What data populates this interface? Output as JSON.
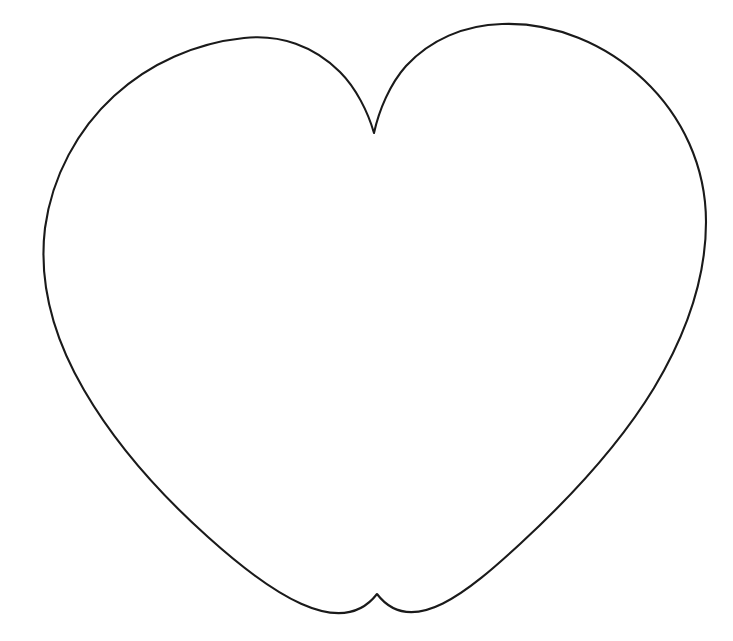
{
  "document": {
    "type": "line-art-drawing",
    "subject": "heart outline",
    "title": "Heart Outline Template",
    "background_color": "#ffffff",
    "width": 733,
    "height": 641,
    "text_content": [],
    "notes": "Single closed black outline of a symmetrical heart shape on a plain white background. No text, labels, numbers, or UI controls are present in the image."
  },
  "figure": {
    "name": "heart-shape",
    "stroke_color": "#1a1a1a",
    "stroke_width": 2.1,
    "fill": "none",
    "rendering": "hand-drawn scanned line art",
    "landmarks": {
      "left_lobe_apex": {
        "x": 218,
        "y": 38
      },
      "right_lobe_apex": {
        "x": 527,
        "y": 23
      },
      "top_cleft_notch": {
        "x": 374,
        "y": 133
      },
      "leftmost_point": {
        "x": 45,
        "y": 235
      },
      "rightmost_point": {
        "x": 706,
        "y": 210
      },
      "bottom_tip": {
        "x": 377,
        "y": 594
      }
    },
    "bounding_box": {
      "x": 44,
      "y": 21,
      "width": 663,
      "height": 575
    },
    "path_d": "M 374 133 C 368 112 356 88 340 72 C 314 46 280 34 244 38 C 196 43 150 63 114 96 C 78 129 52 176 45 228 C 38 286 56 342 84 390 C 116 445 160 494 208 537 C 268 591 340 642 377 594 L 377 594 C 412 640 470 590 520 544 C 572 496 620 444 654 388 C 684 338 706 280 706 222 C 706 166 682 116 644 80 C 606 44 554 22 502 24 C 464 25 430 40 406 66 C 390 84 379 110 374 133 Z",
    "path_segments": [
      {
        "name": "left-lobe-upper",
        "description": "from cleft notch up-left over the left lobe crest to the left extremity",
        "d": "M 374 133 C 366 110 353 86 336 70 C 310 45 276 33 242 38 C 194 44 148 65 112 98 C 77 131 50 177 45 230"
      },
      {
        "name": "left-lower-flank",
        "description": "left extremity curving down and right toward the bottom tip",
        "d": "M 45 230 C 41 290 60 348 90 398 C 124 454 170 503 220 547 C 270 590 340 600 377 594"
      },
      {
        "name": "right-lower-flank",
        "description": "bottom tip rising right to the right extremity",
        "d": "M 377 594 C 416 600 482 586 530 544 C 580 500 626 450 658 394 C 688 342 708 282 706 216"
      },
      {
        "name": "right-lobe-upper",
        "description": "right extremity curving up and left over the right lobe crest back to the cleft notch",
        "d": "M 706 216 C 704 160 680 112 642 78 C 604 44 552 22 500 24 C 462 26 428 41 405 67 C 388 86 379 111 374 133"
      }
    ]
  },
  "chart_data": {
    "type": "line",
    "title": "Heart Outline Template",
    "xlabel": "",
    "ylabel": "",
    "xlim": [
      0,
      733
    ],
    "ylim": [
      641,
      0
    ],
    "grid": false,
    "legend": "none",
    "series": [
      {
        "name": "heart-outline",
        "closed": true,
        "color": "#1a1a1a",
        "linewidth": 2.1,
        "x": [
          374,
          366,
          353,
          336,
          310,
          276,
          242,
          194,
          148,
          112,
          77,
          45,
          41,
          60,
          90,
          124,
          170,
          220,
          270,
          340,
          377,
          416,
          482,
          530,
          580,
          626,
          658,
          688,
          706,
          704,
          680,
          642,
          604,
          552,
          500,
          462,
          428,
          405,
          374
        ],
        "y": [
          133,
          110,
          86,
          70,
          45,
          33,
          38,
          44,
          65,
          98,
          131,
          230,
          290,
          348,
          398,
          454,
          503,
          547,
          590,
          600,
          594,
          600,
          586,
          544,
          500,
          450,
          394,
          342,
          216,
          160,
          112,
          78,
          44,
          22,
          24,
          26,
          41,
          67,
          133
        ]
      }
    ]
  }
}
